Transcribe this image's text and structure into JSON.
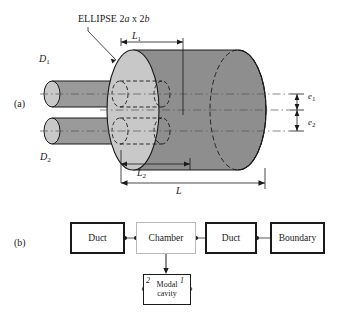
{
  "figure": {
    "panel_a": {
      "label": "(a)",
      "annotation": "ELLIPSE 2a x 2b",
      "dimensions": [
        {
          "name": "L1",
          "base": "L",
          "sub": "1"
        },
        {
          "name": "L2",
          "base": "L",
          "sub": "2"
        },
        {
          "name": "L",
          "base": "L",
          "sub": ""
        },
        {
          "name": "D1",
          "base": "D",
          "sub": "1"
        },
        {
          "name": "D2",
          "base": "D",
          "sub": "2"
        },
        {
          "name": "e1",
          "base": "e",
          "sub": "1"
        },
        {
          "name": "e2",
          "base": "e",
          "sub": "2"
        }
      ]
    },
    "panel_b": {
      "label": "(b)",
      "blocks": [
        {
          "id": "duct-1",
          "label": "Duct"
        },
        {
          "id": "chamber",
          "label": "Chamber"
        },
        {
          "id": "duct-2",
          "label": "Duct"
        },
        {
          "id": "boundary",
          "label": "Boundary"
        },
        {
          "id": "modal-cavity",
          "label_line1": "Modal",
          "label_line2": "cavity",
          "port_left": "2",
          "port_right": "1"
        }
      ]
    }
  },
  "colors": {
    "body_gray": "#8e8e8e",
    "face_light": "#c8c8c8",
    "duct_gray": "#9a9a9a",
    "line": "#1a1a1a",
    "thin_border": "#b9b9b9"
  }
}
